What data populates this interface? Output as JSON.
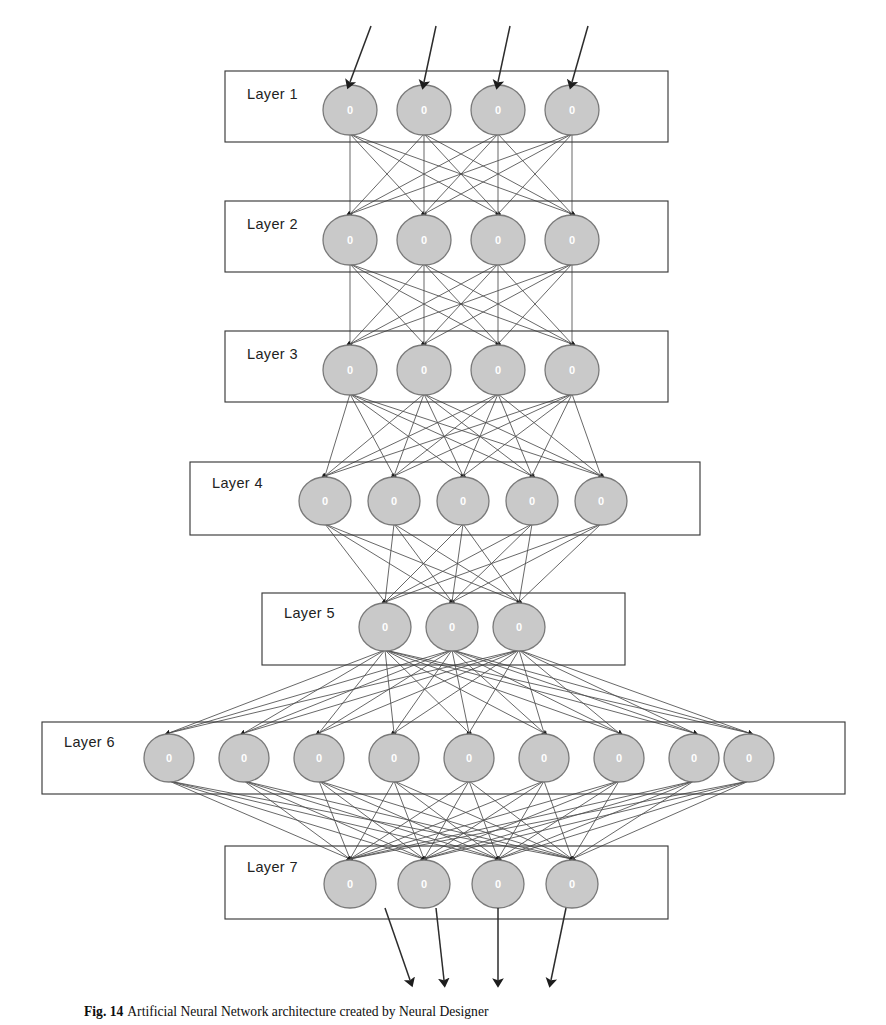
{
  "figure": {
    "caption_label": "Fig. 14",
    "caption_text": "Artificial Neural Network architecture created by Neural Designer",
    "title": "Artificial Neural Network architecture"
  },
  "colors": {
    "neuron_fill": "#c9c9c9",
    "neuron_stroke": "#7a7a7a",
    "neuron_label": "#ffffff",
    "box_stroke": "#3a3a3a",
    "connection": "#4d4d4d",
    "background": "#ffffff"
  },
  "diagram": {
    "type": "neural-network",
    "layer_count": 7,
    "input_arrow_count": 4,
    "output_arrow_count": 4,
    "neuron_label": "0",
    "layers": [
      {
        "label": "Layer 1",
        "index": 1,
        "neuron_count": 4,
        "box": {
          "x": 225,
          "y": 71,
          "w": 443,
          "h": 71
        },
        "label_pos": {
          "x": 247,
          "y": 99
        },
        "node_y": 110,
        "rx": 27,
        "ry": 25,
        "node_x": [
          350,
          424,
          498,
          572
        ]
      },
      {
        "label": "Layer 2",
        "index": 2,
        "neuron_count": 4,
        "box": {
          "x": 225,
          "y": 201,
          "w": 443,
          "h": 71
        },
        "label_pos": {
          "x": 247,
          "y": 229
        },
        "node_y": 240,
        "rx": 27,
        "ry": 25,
        "node_x": [
          350,
          424,
          498,
          572
        ]
      },
      {
        "label": "Layer 3",
        "index": 3,
        "neuron_count": 4,
        "box": {
          "x": 225,
          "y": 331,
          "w": 443,
          "h": 71
        },
        "label_pos": {
          "x": 247,
          "y": 359
        },
        "node_y": 370,
        "rx": 27,
        "ry": 25,
        "node_x": [
          350,
          424,
          498,
          572
        ]
      },
      {
        "label": "Layer 4",
        "index": 4,
        "neuron_count": 5,
        "box": {
          "x": 190,
          "y": 462,
          "w": 510,
          "h": 73
        },
        "label_pos": {
          "x": 212,
          "y": 488
        },
        "node_y": 501,
        "rx": 26,
        "ry": 24,
        "node_x": [
          325,
          394,
          463,
          532,
          601
        ]
      },
      {
        "label": "Layer 5",
        "index": 5,
        "neuron_count": 3,
        "box": {
          "x": 262,
          "y": 593,
          "w": 363,
          "h": 72
        },
        "label_pos": {
          "x": 284,
          "y": 618
        },
        "node_y": 627,
        "rx": 26,
        "ry": 24,
        "node_x": [
          385,
          452,
          519
        ]
      },
      {
        "label": "Layer 6",
        "index": 6,
        "neuron_count": 9,
        "box": {
          "x": 42,
          "y": 722,
          "w": 803,
          "h": 72
        },
        "label_pos": {
          "x": 64,
          "y": 747
        },
        "node_y": 758,
        "rx": 25,
        "ry": 24,
        "node_x": [
          169,
          244,
          319,
          394,
          469,
          544,
          619,
          694,
          749
        ]
      },
      {
        "label": "Layer 7",
        "index": 7,
        "neuron_count": 4,
        "box": {
          "x": 225,
          "y": 846,
          "w": 443,
          "h": 73
        },
        "label_pos": {
          "x": 247,
          "y": 872
        },
        "node_y": 884,
        "rx": 26,
        "ry": 24,
        "node_x": [
          350,
          424,
          498,
          572
        ]
      }
    ],
    "input_arrows": [
      {
        "x1": 371,
        "y1": 26,
        "x2": 350,
        "y2": 82
      },
      {
        "x1": 436,
        "y1": 26,
        "x2": 424,
        "y2": 82
      },
      {
        "x1": 510,
        "y1": 26,
        "x2": 498,
        "y2": 82
      },
      {
        "x1": 588,
        "y1": 26,
        "x2": 572,
        "y2": 82
      }
    ],
    "output_arrows": [
      {
        "x1": 385,
        "y1": 908,
        "x2": 410,
        "y2": 980
      },
      {
        "x1": 436,
        "y1": 908,
        "x2": 444,
        "y2": 980
      },
      {
        "x1": 498,
        "y1": 908,
        "x2": 498,
        "y2": 980
      },
      {
        "x1": 566,
        "y1": 908,
        "x2": 551,
        "y2": 980
      }
    ]
  }
}
